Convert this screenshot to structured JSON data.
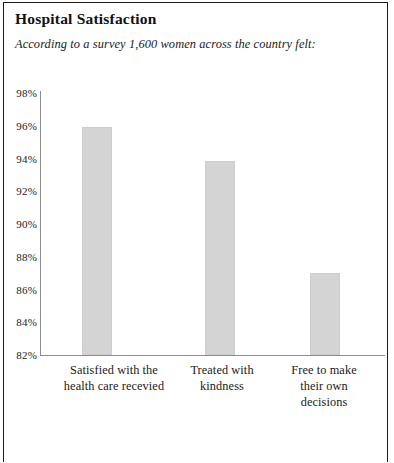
{
  "chart_title": "Hospital Satisfaction",
  "chart_subtitle": "According to a survey 1,600 women across the country felt:",
  "colors": {
    "bar_fill": "#d4d4d4",
    "bar_stroke": "#cdcdcd",
    "axis": "#8d8d8d",
    "frame": "#1a1a1a",
    "text": "#1a1a1a"
  },
  "chart_data": {
    "type": "bar",
    "title": "Hospital Satisfaction",
    "subtitle": "According to a survey 1,600 women across the country felt:",
    "xlabel": "",
    "ylabel": "",
    "categories": [
      "Satisfied with the health care recevied",
      "Treated with kindness",
      "Free to make their own decisions"
    ],
    "category_lines": [
      [
        "Satisfied with the",
        "health care recevied"
      ],
      [
        "Treated with",
        "kindness"
      ],
      [
        "Free to make",
        "their own",
        "decisions"
      ]
    ],
    "values": [
      95.9,
      93.85,
      87.0
    ],
    "ylim": [
      82,
      98
    ],
    "ytick_values": [
      98,
      96,
      94,
      92,
      90,
      88,
      86,
      84,
      82
    ],
    "ytick_labels": [
      "98%",
      "96%",
      "94%",
      "92%",
      "90%",
      "88%",
      "86%",
      "84%",
      "82%"
    ],
    "grid": false,
    "legend": false
  }
}
